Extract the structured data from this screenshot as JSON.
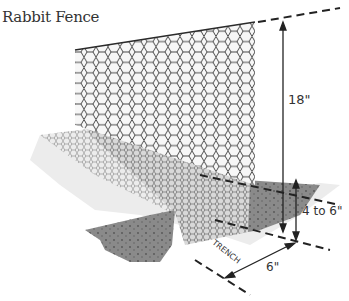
{
  "title": "Rabbit Fence",
  "labels": {
    "fence_height": "18\"",
    "trench_depth": "4 to 6\"",
    "trench_width": "6\"",
    "trench": "TRENCH"
  },
  "colors": {
    "mesh": "#3a3a3a",
    "soil": "#8a8a8a",
    "soil_dark": "#6e6e6e",
    "ground": "#e6e6e6",
    "dimension_line": "#222222"
  }
}
